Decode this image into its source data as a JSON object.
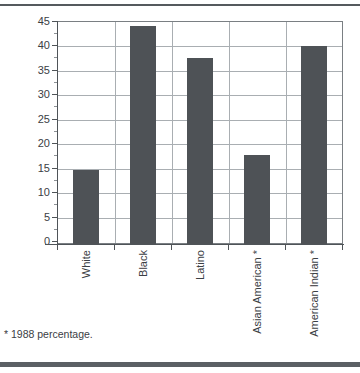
{
  "chart_data": {
    "type": "bar",
    "title": "",
    "subtitle": "",
    "xlabel": "",
    "ylabel": "",
    "categories": [
      "White",
      "Black",
      "Latino",
      "Asian American *",
      "American Indian *"
    ],
    "values": [
      15,
      44,
      37.5,
      18,
      40
    ],
    "ylim": [
      0,
      45
    ],
    "ytick_values": [
      0,
      5,
      10,
      15,
      20,
      25,
      30,
      35,
      40,
      45
    ],
    "ytick_labels": [
      "0",
      "5",
      "10",
      "15",
      "20",
      "25",
      "30",
      "35",
      "40",
      "45"
    ],
    "grid": true,
    "grid_axis": "both",
    "legend": false,
    "legend_position": "none",
    "bar_color": "#4e5256",
    "gridline_color": "#a9aeb2",
    "axis_color": "#4f5458",
    "text_color": "#3b4044",
    "background_color": "#ffffff",
    "xtick_label_rotation": 90,
    "annotations": [
      "* 1988 percentage."
    ]
  },
  "figure": {
    "footnote": "* 1988 percentage."
  }
}
